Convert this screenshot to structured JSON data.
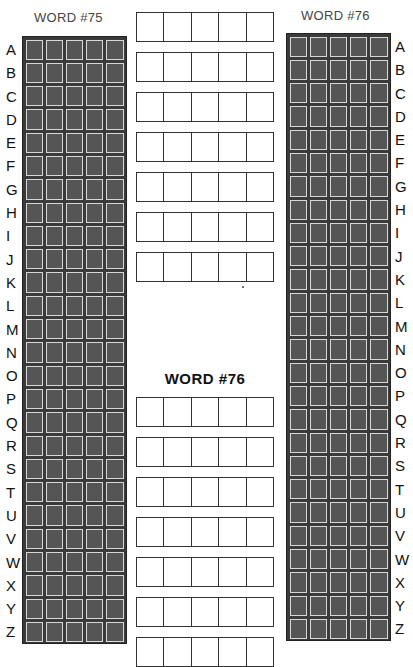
{
  "left_panel": {
    "title": "WORD #75",
    "letters": [
      "A",
      "B",
      "C",
      "D",
      "E",
      "F",
      "G",
      "H",
      "I",
      "J",
      "K",
      "L",
      "M",
      "N",
      "O",
      "P",
      "Q",
      "R",
      "S",
      "T",
      "U",
      "V",
      "W",
      "X",
      "Y",
      "Z"
    ],
    "columns": 5
  },
  "right_panel": {
    "title": "WORD #76",
    "letters": [
      "A",
      "B",
      "C",
      "D",
      "E",
      "F",
      "G",
      "H",
      "I",
      "J",
      "K",
      "L",
      "M",
      "N",
      "O",
      "P",
      "Q",
      "R",
      "S",
      "T",
      "U",
      "V",
      "W",
      "X",
      "Y",
      "Z"
    ],
    "columns": 5
  },
  "center_top": {
    "rows": 7,
    "letters_per_row": 5
  },
  "center_bottom": {
    "title": "WORD #76",
    "rows": 7,
    "letters_per_row": 5
  },
  "colors": {
    "cell_fill": "#555555",
    "grid_bg": "#3a3a3a",
    "cell_border": "#d8d8d8",
    "box_border": "#333333"
  }
}
